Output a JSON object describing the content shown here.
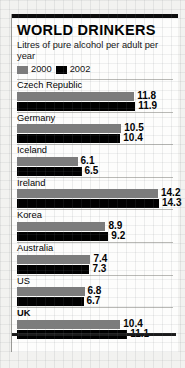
{
  "panel": {
    "title": "WORLD DRINKERS",
    "subtitle": "Litres of pure alcohol per adult per year"
  },
  "legend": {
    "items": [
      {
        "label": "2000",
        "color": "#7c7c7c",
        "swatch_name": "legend-swatch-2000"
      },
      {
        "label": "2002",
        "color": "#000000",
        "swatch_name": "legend-swatch-2002"
      }
    ]
  },
  "chart_data": {
    "type": "bar",
    "title": "WORLD DRINKERS",
    "subtitle": "Litres of pure alcohol per adult per year",
    "xlabel": "Litres of pure alcohol per adult per year",
    "ylabel": "",
    "orientation": "horizontal",
    "grid": false,
    "legend_position": "top-left",
    "xlim": [
      0,
      14.3
    ],
    "categories": [
      "Czech Republic",
      "Germany",
      "Iceland",
      "Ireland",
      "Korea",
      "Australia",
      "US",
      "UK"
    ],
    "highlighted_category": "UK",
    "series": [
      {
        "name": "2000",
        "color": "#7c7c7c",
        "values": [
          11.8,
          10.5,
          6.1,
          14.2,
          8.9,
          7.4,
          6.8,
          10.4
        ]
      },
      {
        "name": "2002",
        "color": "#000000",
        "values": [
          11.9,
          10.4,
          6.5,
          14.3,
          9.2,
          7.3,
          6.7,
          11.1
        ]
      }
    ],
    "value_labels": {
      "Czech Republic": [
        "11.8",
        "11.9"
      ],
      "Germany": [
        "10.5",
        "10.4"
      ],
      "Iceland": [
        "6.1",
        "6.5"
      ],
      "Ireland": [
        "14.2",
        "14.3"
      ],
      "Korea": [
        "8.9",
        "9.2"
      ],
      "Australia": [
        "7.4",
        "7.3"
      ],
      "US": [
        "6.8",
        "6.7"
      ],
      "UK": [
        "10.4",
        "11.1"
      ]
    }
  }
}
